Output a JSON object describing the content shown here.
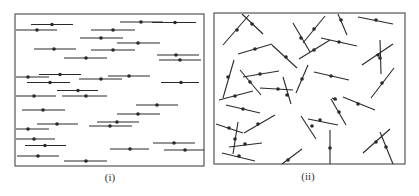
{
  "figure": {
    "colors": {
      "line": "#2a2a2a",
      "border": "#555555",
      "background": "#ffffff"
    },
    "panels": [
      {
        "label": "(i)",
        "description": "aligned (nematic) rods",
        "frame": {
          "x": 15,
          "y": 14,
          "w": 189,
          "h": 152
        },
        "rods": [
          {
            "x1": 31,
            "y1": 24.5,
            "x2": 73,
            "y2": 24.5,
            "cx": 52,
            "cy": 24.5
          },
          {
            "x1": 16,
            "y1": 30,
            "x2": 57,
            "y2": 30,
            "cx": 37,
            "cy": 30
          },
          {
            "x1": 120,
            "y1": 22,
            "x2": 163,
            "y2": 22,
            "cx": 141,
            "cy": 22
          },
          {
            "x1": 152,
            "y1": 22.5,
            "x2": 196,
            "y2": 22.5,
            "cx": 175,
            "cy": 22.5
          },
          {
            "x1": 91,
            "y1": 30,
            "x2": 135,
            "y2": 30,
            "cx": 113,
            "cy": 30
          },
          {
            "x1": 80,
            "y1": 38,
            "x2": 123,
            "y2": 38,
            "cx": 101,
            "cy": 38
          },
          {
            "x1": 117,
            "y1": 43,
            "x2": 160,
            "y2": 43,
            "cx": 138,
            "cy": 43
          },
          {
            "x1": 34,
            "y1": 49,
            "x2": 76,
            "y2": 49,
            "cx": 54,
            "cy": 49
          },
          {
            "x1": 91,
            "y1": 50,
            "x2": 135,
            "y2": 50,
            "cx": 113,
            "cy": 50
          },
          {
            "x1": 157,
            "y1": 55,
            "x2": 199,
            "y2": 55,
            "cx": 176,
            "cy": 55
          },
          {
            "x1": 64,
            "y1": 58,
            "x2": 107,
            "y2": 58,
            "cx": 86,
            "cy": 58
          },
          {
            "x1": 159,
            "y1": 60,
            "x2": 201,
            "y2": 60,
            "cx": 180,
            "cy": 60
          },
          {
            "x1": 39,
            "y1": 74.5,
            "x2": 81,
            "y2": 74.5,
            "cx": 60,
            "cy": 74.5
          },
          {
            "x1": 16,
            "y1": 77,
            "x2": 49,
            "y2": 77,
            "cx": 28,
            "cy": 77
          },
          {
            "x1": 108,
            "y1": 76,
            "x2": 150,
            "y2": 76,
            "cx": 129,
            "cy": 76
          },
          {
            "x1": 79,
            "y1": 79,
            "x2": 122,
            "y2": 79,
            "cx": 101,
            "cy": 79
          },
          {
            "x1": 27,
            "y1": 82.5,
            "x2": 70,
            "y2": 82.5,
            "cx": 50,
            "cy": 82.5
          },
          {
            "x1": 161,
            "y1": 82.5,
            "x2": 199,
            "y2": 82.5,
            "cx": 181,
            "cy": 82.5
          },
          {
            "x1": 57,
            "y1": 90.5,
            "x2": 98,
            "y2": 90.5,
            "cx": 78,
            "cy": 90.5
          },
          {
            "x1": 16,
            "y1": 96,
            "x2": 56,
            "y2": 96,
            "cx": 34,
            "cy": 96
          },
          {
            "x1": 62,
            "y1": 96,
            "x2": 107,
            "y2": 96,
            "cx": 86,
            "cy": 96
          },
          {
            "x1": 136,
            "y1": 105,
            "x2": 178,
            "y2": 105,
            "cx": 157,
            "cy": 105
          },
          {
            "x1": 22,
            "y1": 110,
            "x2": 65,
            "y2": 110,
            "cx": 43,
            "cy": 110
          },
          {
            "x1": 117,
            "y1": 114,
            "x2": 160,
            "y2": 114,
            "cx": 138,
            "cy": 114
          },
          {
            "x1": 97,
            "y1": 122,
            "x2": 139,
            "y2": 122,
            "cx": 117,
            "cy": 122
          },
          {
            "x1": 37,
            "y1": 124,
            "x2": 78,
            "y2": 124,
            "cx": 57,
            "cy": 124
          },
          {
            "x1": 89,
            "y1": 126,
            "x2": 132,
            "y2": 126,
            "cx": 110,
            "cy": 126
          },
          {
            "x1": 16,
            "y1": 129,
            "x2": 49,
            "y2": 129,
            "cx": 28,
            "cy": 129
          },
          {
            "x1": 16,
            "y1": 139,
            "x2": 55,
            "y2": 139,
            "cx": 34,
            "cy": 139
          },
          {
            "x1": 153,
            "y1": 143,
            "x2": 195,
            "y2": 143,
            "cx": 174,
            "cy": 143
          },
          {
            "x1": 25,
            "y1": 145.5,
            "x2": 66,
            "y2": 145.5,
            "cx": 45,
            "cy": 145.5
          },
          {
            "x1": 110,
            "y1": 149,
            "x2": 149,
            "y2": 149,
            "cx": 130,
            "cy": 149
          },
          {
            "x1": 164,
            "y1": 150,
            "x2": 204,
            "y2": 150,
            "cx": 185,
            "cy": 150
          },
          {
            "x1": 17,
            "y1": 156,
            "x2": 59,
            "y2": 156,
            "cx": 38,
            "cy": 156
          },
          {
            "x1": 64,
            "y1": 161,
            "x2": 107,
            "y2": 161,
            "cx": 86,
            "cy": 161
          }
        ]
      },
      {
        "label": "(ii)",
        "description": "randomly oriented (isotropic) rods",
        "frame": {
          "x": 214,
          "y": 13,
          "w": 191,
          "h": 151
        },
        "rods": [
          {
            "x1": 223,
            "y1": 45,
            "x2": 249,
            "y2": 15,
            "cx": 237,
            "cy": 30
          },
          {
            "x1": 242,
            "y1": 14,
            "x2": 263,
            "y2": 34,
            "cx": 252,
            "cy": 24
          },
          {
            "x1": 238,
            "y1": 54,
            "x2": 272,
            "y2": 44,
            "cx": 255,
            "cy": 49
          },
          {
            "x1": 272,
            "y1": 45,
            "x2": 297,
            "y2": 68,
            "cx": 286,
            "cy": 57
          },
          {
            "x1": 293,
            "y1": 23,
            "x2": 310,
            "y2": 52,
            "cx": 301,
            "cy": 38
          },
          {
            "x1": 303,
            "y1": 43,
            "x2": 325,
            "y2": 16,
            "cx": 314,
            "cy": 29
          },
          {
            "x1": 299,
            "y1": 59,
            "x2": 330,
            "y2": 40,
            "cx": 314,
            "cy": 50
          },
          {
            "x1": 321,
            "y1": 38,
            "x2": 357,
            "y2": 46,
            "cx": 339,
            "cy": 42
          },
          {
            "x1": 338,
            "y1": 14,
            "x2": 347,
            "y2": 35,
            "cx": 341,
            "cy": 20
          },
          {
            "x1": 358,
            "y1": 17,
            "x2": 393,
            "y2": 24,
            "cx": 376,
            "cy": 20
          },
          {
            "x1": 362,
            "y1": 65,
            "x2": 393,
            "y2": 44,
            "cx": 378,
            "cy": 55
          },
          {
            "x1": 380,
            "y1": 40,
            "x2": 381,
            "y2": 74,
            "cx": 380,
            "cy": 58
          },
          {
            "x1": 223,
            "y1": 98,
            "x2": 234,
            "y2": 60,
            "cx": 228,
            "cy": 77
          },
          {
            "x1": 240,
            "y1": 70,
            "x2": 261,
            "y2": 95,
            "cx": 250,
            "cy": 82
          },
          {
            "x1": 243,
            "y1": 77,
            "x2": 279,
            "y2": 71,
            "cx": 260,
            "cy": 74
          },
          {
            "x1": 260,
            "y1": 88,
            "x2": 293,
            "y2": 90,
            "cx": 278,
            "cy": 89
          },
          {
            "x1": 283,
            "y1": 77,
            "x2": 291,
            "y2": 104,
            "cx": 287,
            "cy": 95
          },
          {
            "x1": 296,
            "y1": 93,
            "x2": 308,
            "y2": 65,
            "cx": 302,
            "cy": 79
          },
          {
            "x1": 314,
            "y1": 72,
            "x2": 349,
            "y2": 80,
            "cx": 331,
            "cy": 76
          },
          {
            "x1": 371,
            "y1": 98,
            "x2": 394,
            "y2": 68,
            "cx": 382,
            "cy": 83
          },
          {
            "x1": 219,
            "y1": 100,
            "x2": 253,
            "y2": 91,
            "cx": 235,
            "cy": 96
          },
          {
            "x1": 332,
            "y1": 98,
            "x2": 337,
            "y2": 100,
            "cx": 335,
            "cy": 99
          },
          {
            "x1": 226,
            "y1": 105,
            "x2": 260,
            "y2": 113,
            "cx": 243,
            "cy": 109
          },
          {
            "x1": 216,
            "y1": 124,
            "x2": 243,
            "y2": 133,
            "cx": 229,
            "cy": 128
          },
          {
            "x1": 244,
            "y1": 133,
            "x2": 275,
            "y2": 115,
            "cx": 258,
            "cy": 124
          },
          {
            "x1": 233,
            "y1": 154,
            "x2": 238,
            "y2": 122,
            "cx": 235,
            "cy": 139
          },
          {
            "x1": 229,
            "y1": 147,
            "x2": 262,
            "y2": 143,
            "cx": 245,
            "cy": 144
          },
          {
            "x1": 222,
            "y1": 153,
            "x2": 255,
            "y2": 161,
            "cx": 239,
            "cy": 156
          },
          {
            "x1": 282,
            "y1": 164,
            "x2": 302,
            "y2": 149,
            "cx": 288,
            "cy": 160
          },
          {
            "x1": 301,
            "y1": 116,
            "x2": 316,
            "y2": 139,
            "cx": 312,
            "cy": 126
          },
          {
            "x1": 308,
            "y1": 119,
            "x2": 338,
            "y2": 125,
            "cx": 320,
            "cy": 120
          },
          {
            "x1": 331,
            "y1": 99,
            "x2": 346,
            "y2": 125,
            "cx": 339,
            "cy": 112
          },
          {
            "x1": 343,
            "y1": 97,
            "x2": 375,
            "y2": 110,
            "cx": 358,
            "cy": 104
          },
          {
            "x1": 330,
            "y1": 130,
            "x2": 330,
            "y2": 164,
            "cx": 330,
            "cy": 148
          },
          {
            "x1": 363,
            "y1": 153,
            "x2": 390,
            "y2": 129,
            "cx": 376,
            "cy": 142
          },
          {
            "x1": 380,
            "y1": 132,
            "x2": 393,
            "y2": 164,
            "cx": 386,
            "cy": 147
          }
        ]
      }
    ]
  }
}
